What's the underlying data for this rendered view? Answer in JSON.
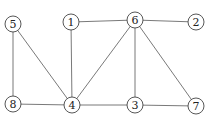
{
  "diagram": {
    "type": "undirected-graph",
    "node_radius": 8,
    "colors": {
      "edge": "#6a6a6a",
      "node_stroke": "#444444",
      "node_fill": "#ffffff",
      "label": "#222222"
    },
    "nodes": [
      {
        "id": "5",
        "label": "5",
        "x": 13,
        "y": 24
      },
      {
        "id": "1",
        "label": "1",
        "x": 71,
        "y": 22
      },
      {
        "id": "6",
        "label": "6",
        "x": 135,
        "y": 20
      },
      {
        "id": "2",
        "label": "2",
        "x": 196,
        "y": 22
      },
      {
        "id": "8",
        "label": "8",
        "x": 13,
        "y": 104
      },
      {
        "id": "4",
        "label": "4",
        "x": 72,
        "y": 105
      },
      {
        "id": "3",
        "label": "3",
        "x": 135,
        "y": 105
      },
      {
        "id": "7",
        "label": "7",
        "x": 196,
        "y": 106
      }
    ],
    "edges": [
      [
        "5",
        "8"
      ],
      [
        "5",
        "4"
      ],
      [
        "1",
        "4"
      ],
      [
        "1",
        "6"
      ],
      [
        "6",
        "2"
      ],
      [
        "6",
        "4"
      ],
      [
        "6",
        "3"
      ],
      [
        "6",
        "7"
      ],
      [
        "8",
        "4"
      ],
      [
        "4",
        "3"
      ],
      [
        "3",
        "7"
      ]
    ]
  }
}
